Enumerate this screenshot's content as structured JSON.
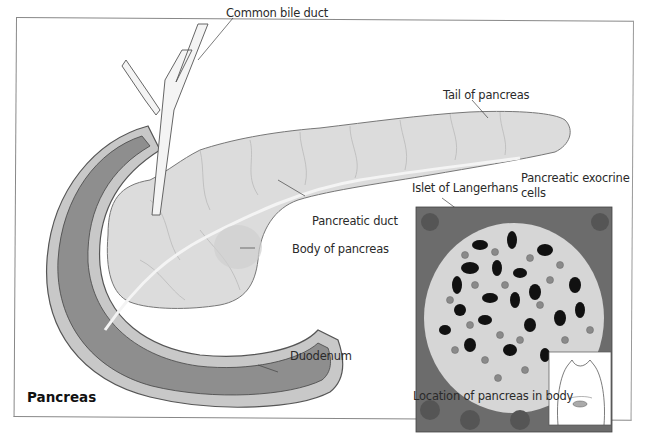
{
  "figure": {
    "title": "Pancreas",
    "labels": {
      "common_bile_duct": "Common bile duct",
      "tail": "Tail of pancreas",
      "pancreatic_duct": "Pancreatic duct",
      "body": "Body of pancreas",
      "duodenum": "Duodenum",
      "islet": "Islet of Langerhans",
      "exocrine_line1": "Pancreatic exocrine",
      "exocrine_line2": "cells",
      "location": "Location of pancreas in body"
    },
    "colors": {
      "pancreas_fill": "#dcdcdc",
      "duodenum_fill": "#8e8e8e",
      "duodenum_wall": "#c8c8c8",
      "duct": "#f2f2f2",
      "acinar": "#6e6e6e",
      "islet_bg": "#d8d8d8",
      "beta_cell": "#111111",
      "alpha_cell": "#8a8a8a"
    }
  }
}
